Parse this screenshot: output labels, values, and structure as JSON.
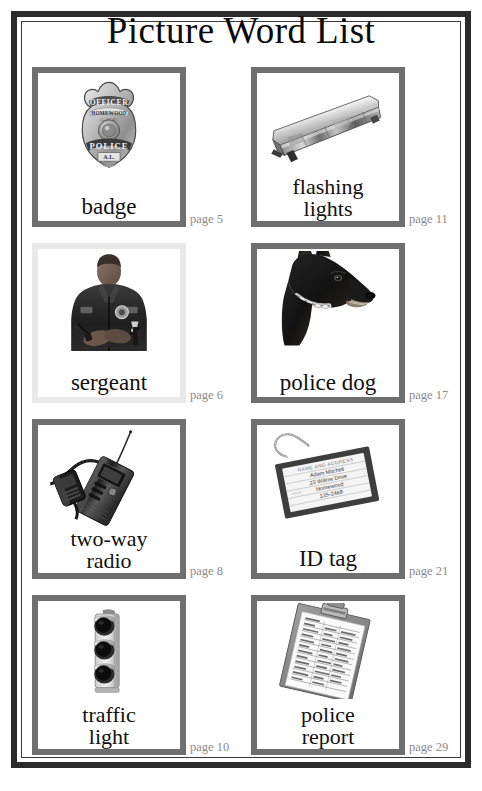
{
  "title": "Picture Word List",
  "entries": [
    {
      "word": "badge",
      "page_label": "page 5",
      "icon": "police-badge-icon",
      "border": "#6f6f6f",
      "badge_text": {
        "top": "OFFICER",
        "city": "HOMEWOOD",
        "sub": "ALABAMA",
        "bottom": "POLICE",
        "state": "A.L."
      }
    },
    {
      "word": "flashing lights",
      "word_line1": "flashing",
      "word_line2": "lights",
      "page_label": "page 11",
      "icon": "police-lightbar-icon",
      "border": "#6f6f6f"
    },
    {
      "word": "sergeant",
      "page_label": "page 6",
      "icon": "police-sergeant-photo-icon",
      "border": "#e9e9e9"
    },
    {
      "word": "police dog",
      "page_label": "page 17",
      "icon": "police-dog-icon",
      "border": "#6f6f6f"
    },
    {
      "word": "two-way radio",
      "word_line1": "two-way",
      "word_line2": "radio",
      "page_label": "page 8",
      "icon": "two-way-radio-icon",
      "border": "#6f6f6f"
    },
    {
      "word": "ID tag",
      "page_label": "page 21",
      "icon": "id-tag-icon",
      "border": "#6f6f6f",
      "tag_text": {
        "header": "NAME AND ADDRESS",
        "name": "Adam Mitchell",
        "street": "23 Willow Drive",
        "city": "Homewood",
        "phone": "135-2468",
        "side": "PHONE"
      }
    },
    {
      "word": "traffic light",
      "word_line1": "traffic",
      "word_line2": "light",
      "page_label": "page 10",
      "icon": "traffic-light-icon",
      "border": "#6f6f6f"
    },
    {
      "word": "police report",
      "word_line1": "police",
      "word_line2": "report",
      "page_label": "page 29",
      "icon": "clipboard-report-icon",
      "border": "#6f6f6f"
    }
  ],
  "colors": {
    "frame": "#2b2b2b",
    "card_border": "#6f6f6f",
    "card_border_light": "#e9e9e9",
    "page_text": "#8b8b8b",
    "word_text": "#111111"
  }
}
